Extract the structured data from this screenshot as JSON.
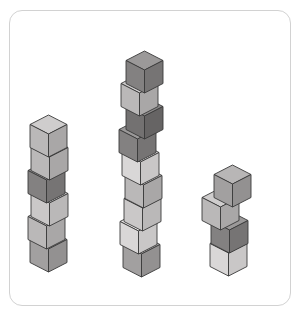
{
  "figure": {
    "title": "",
    "type": "isometric-cube-stacks",
    "background_color": "#ffffff",
    "frame": {
      "shape": "rounded-rectangle",
      "border_color": "#d2d2d2",
      "border_width": 1.4,
      "corner_radius": 13,
      "x": 9,
      "y": 10,
      "width": 282,
      "height": 296
    },
    "cube_geometry": {
      "half_width": 18.5,
      "top_height": 9.5,
      "side_height": 23,
      "outline_color": "#3a3a3a",
      "outline_width": 0.9
    },
    "palette": {
      "light": {
        "top": "#eceaea",
        "left": "#d9d7d7",
        "right": "#c9c7c7"
      },
      "light_mid": {
        "top": "#dedcdc",
        "left": "#cac8c8",
        "right": "#bab8b8"
      },
      "mid": {
        "top": "#cfcdcd",
        "left": "#bab8b8",
        "right": "#a9a7a7"
      },
      "mid_dark": {
        "top": "#b8b6b6",
        "left": "#a2a0a0",
        "right": "#939191"
      },
      "dark": {
        "top": "#9b9999",
        "left": "#838181",
        "right": "#767474"
      },
      "darker": {
        "top": "#8a8888",
        "left": "#737171",
        "right": "#666464"
      }
    },
    "stacks": [
      {
        "name": "left-stack",
        "cube_count": 6,
        "base_x": 48,
        "base_y": 272,
        "cubes": [
          {
            "index": 0,
            "position": "bottom",
            "shade": "mid_dark",
            "dx": 0
          },
          {
            "index": 1,
            "position": "2nd-from-bottom",
            "shade": "mid",
            "dx": -2
          },
          {
            "index": 2,
            "position": "3rd-from-bottom",
            "shade": "light_mid",
            "dx": 1
          },
          {
            "index": 3,
            "position": "4th-from-bottom",
            "shade": "dark",
            "dx": -2
          },
          {
            "index": 4,
            "position": "5th-from-bottom",
            "shade": "mid",
            "dx": 1
          },
          {
            "index": 5,
            "position": "top",
            "shade": "mid",
            "dx": 0
          }
        ]
      },
      {
        "name": "middle-stack",
        "cube_count": 9,
        "base_x": 141,
        "base_y": 277,
        "cubes": [
          {
            "index": 0,
            "position": "bottom",
            "shade": "mid_dark",
            "dx": 0
          },
          {
            "index": 1,
            "position": "2nd-from-bottom",
            "shade": "light",
            "dx": -3
          },
          {
            "index": 2,
            "position": "3rd-from-bottom",
            "shade": "light_mid",
            "dx": 1
          },
          {
            "index": 3,
            "position": "4th-from-bottom",
            "shade": "mid",
            "dx": 2
          },
          {
            "index": 4,
            "position": "5th-from-bottom",
            "shade": "light",
            "dx": -1
          },
          {
            "index": 5,
            "position": "6th-from-bottom",
            "shade": "dark",
            "dx": -4
          },
          {
            "index": 6,
            "position": "7th-from-bottom",
            "shade": "darker",
            "dx": 3
          },
          {
            "index": 7,
            "position": "8th-from-bottom",
            "shade": "mid",
            "dx": -2
          },
          {
            "index": 8,
            "position": "top",
            "shade": "dark",
            "dx": 3
          }
        ]
      },
      {
        "name": "right-stack",
        "cube_count": 4,
        "base_x": 228,
        "base_y": 276,
        "cubes": [
          {
            "index": 0,
            "position": "bottom",
            "shade": "light",
            "dx": 0
          },
          {
            "index": 1,
            "position": "2nd-from-bottom",
            "shade": "dark",
            "dx": 1
          },
          {
            "index": 2,
            "position": "3rd-from-bottom",
            "shade": "mid",
            "dx": -8
          },
          {
            "index": 3,
            "position": "top",
            "shade": "mid_dark",
            "dx": 4
          }
        ]
      }
    ]
  }
}
